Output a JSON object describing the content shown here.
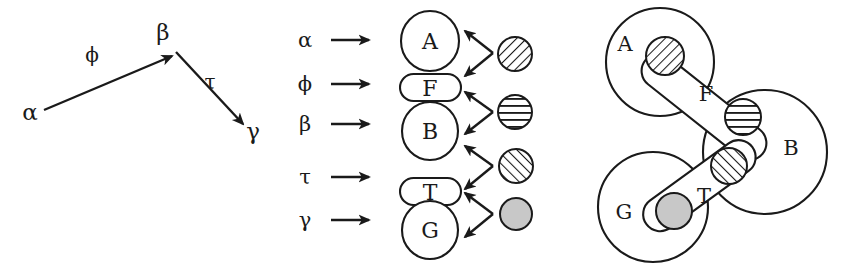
{
  "figure": {
    "background_color": "#ffffff",
    "ink_color": "#1a1a1a",
    "gray_fill_color": "#c8c8c8"
  },
  "panel_left": {
    "name": "path-graph",
    "nodes": [
      {
        "id": "alpha",
        "label": "α",
        "x": 30,
        "y": 112
      },
      {
        "id": "beta",
        "label": "β",
        "x": 163,
        "y": 32
      },
      {
        "id": "gamma",
        "label": "γ",
        "x": 253,
        "y": 131
      }
    ],
    "edges": [
      {
        "id": "phi",
        "label": "ϕ",
        "from": "alpha",
        "to": "beta",
        "label_x": 92,
        "label_y": 55
      },
      {
        "id": "tau",
        "label": "τ",
        "from": "beta",
        "to": "gamma",
        "label_x": 210,
        "label_y": 82
      }
    ]
  },
  "panel_middle": {
    "name": "mapping-column",
    "rows": [
      {
        "greek": "α",
        "shape_label": "A",
        "shape_kind": "circle"
      },
      {
        "greek": "ϕ",
        "shape_label": "F",
        "shape_kind": "ellipse"
      },
      {
        "greek": "β",
        "shape_label": "B",
        "shape_kind": "circle"
      },
      {
        "greek": "τ",
        "shape_label": "T",
        "shape_kind": "ellipse"
      },
      {
        "greek": "γ",
        "shape_label": "G",
        "shape_kind": "circle"
      }
    ],
    "markers": [
      {
        "id": "marker-1",
        "pattern": "diagonal-backslash",
        "connects": [
          "A",
          "F"
        ]
      },
      {
        "id": "marker-2",
        "pattern": "horizontal-lines",
        "connects": [
          "F",
          "B"
        ]
      },
      {
        "id": "marker-3",
        "pattern": "diagonal-slash",
        "connects": [
          "B",
          "T"
        ]
      },
      {
        "id": "marker-4",
        "pattern": "solid-gray",
        "connects": [
          "T",
          "G"
        ]
      }
    ]
  },
  "panel_right": {
    "name": "set-diagram",
    "sets": [
      {
        "label": "A",
        "kind": "circle",
        "label_x": 625,
        "label_y": 44
      },
      {
        "label": "B",
        "kind": "circle",
        "label_x": 791,
        "label_y": 148
      },
      {
        "label": "G",
        "kind": "circle",
        "label_x": 624,
        "label_y": 212
      },
      {
        "label": "F",
        "kind": "capsule",
        "label_x": 704,
        "label_y": 95
      },
      {
        "label": "T",
        "kind": "capsule",
        "label_x": 704,
        "label_y": 196
      }
    ],
    "markers": [
      {
        "id": "r-marker-1",
        "pattern": "diagonal-backslash",
        "inside": [
          "A",
          "F"
        ]
      },
      {
        "id": "r-marker-2",
        "pattern": "horizontal-lines",
        "inside": [
          "F",
          "B"
        ]
      },
      {
        "id": "r-marker-3",
        "pattern": "diagonal-slash",
        "inside": [
          "B",
          "T"
        ]
      },
      {
        "id": "r-marker-4",
        "pattern": "solid-gray",
        "inside": [
          "T",
          "G"
        ]
      }
    ]
  }
}
